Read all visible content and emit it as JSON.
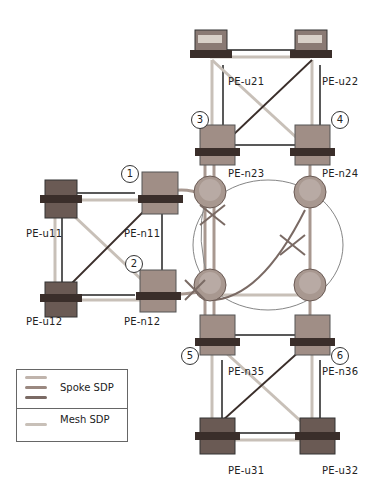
{
  "diagram": {
    "type": "network-topology",
    "nodes": {
      "pe_u21": "PE-u21",
      "pe_u22": "PE-u22",
      "pe_n23": "PE-n23",
      "pe_n24": "PE-n24",
      "pe_u11": "PE-u11",
      "pe_n11": "PE-n11",
      "pe_u12": "PE-u12",
      "pe_n12": "PE-n12",
      "pe_n35": "PE-n35",
      "pe_n36": "PE-n36",
      "pe_u31": "PE-u31",
      "pe_u32": "PE-u32"
    },
    "markers": [
      "1",
      "2",
      "3",
      "4",
      "5",
      "6"
    ],
    "legend": {
      "spoke": "Spoke SDP",
      "mesh": "Mesh SDP"
    },
    "colors": {
      "mesh_sdp": "#c8c0b8",
      "spoke_sdp_1": "#b8a8a0",
      "spoke_sdp_2": "#9a8880",
      "spoke_sdp_3": "#7a6a64",
      "switch_body": "#8a7a74",
      "router_body": "#a89890"
    }
  }
}
